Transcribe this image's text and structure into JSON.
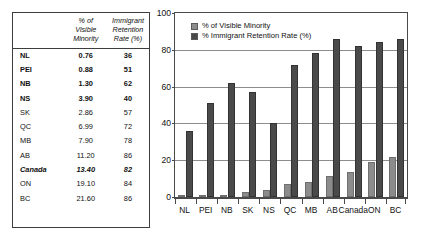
{
  "table": {
    "headers": {
      "corner": "",
      "col1": [
        "% of",
        "Visible",
        "Minority"
      ],
      "col2": [
        "Immigrant",
        "Retention",
        "Rate (%)"
      ]
    },
    "rows": [
      {
        "label": "NL",
        "visible_minority": "0.76",
        "retention_rate": "36",
        "emphasis": "bold"
      },
      {
        "label": "PEI",
        "visible_minority": "0.88",
        "retention_rate": "51",
        "emphasis": "bold"
      },
      {
        "label": "NB",
        "visible_minority": "1.30",
        "retention_rate": "62",
        "emphasis": "bold"
      },
      {
        "label": "NS",
        "visible_minority": "3.90",
        "retention_rate": "40",
        "emphasis": "bold"
      },
      {
        "label": "SK",
        "visible_minority": "2.86",
        "retention_rate": "57",
        "emphasis": "normal"
      },
      {
        "label": "QC",
        "visible_minority": "6.99",
        "retention_rate": "72",
        "emphasis": "normal"
      },
      {
        "label": "MB",
        "visible_minority": "7.90",
        "retention_rate": "78",
        "emphasis": "normal"
      },
      {
        "label": "AB",
        "visible_minority": "11.20",
        "retention_rate": "86",
        "emphasis": "normal"
      },
      {
        "label": "Canada",
        "visible_minority": "13.40",
        "retention_rate": "82",
        "emphasis": "bolditalic"
      },
      {
        "label": "ON",
        "visible_minority": "19.10",
        "retention_rate": "84",
        "emphasis": "normal"
      },
      {
        "label": "BC",
        "visible_minority": "21.60",
        "retention_rate": "86",
        "emphasis": "normal"
      }
    ]
  },
  "chart_data": {
    "type": "bar",
    "title": "",
    "xlabel": "",
    "ylabel": "",
    "ylim": [
      0,
      100
    ],
    "yticks": [
      "0",
      "20",
      "40",
      "60",
      "80",
      "100"
    ],
    "grid": true,
    "legend_position": "top-left",
    "categories": [
      "NL",
      "PEI",
      "NB",
      "SK",
      "NS",
      "QC",
      "MB",
      "AB",
      "Canada",
      "ON",
      "BC"
    ],
    "series": [
      {
        "name": "% of Visible Minority",
        "color": "#8c8c8c",
        "values": [
          0.76,
          0.88,
          1.3,
          2.86,
          3.9,
          6.99,
          7.9,
          11.2,
          13.4,
          19.1,
          21.6
        ]
      },
      {
        "name": "% Immigrant Retention Rate (%)",
        "color": "#4a4a4a",
        "values": [
          36,
          51,
          62,
          57,
          40,
          72,
          78,
          86,
          82,
          84,
          86
        ]
      }
    ]
  },
  "colors": {
    "series1": "#8c8c8c",
    "series2": "#4a4a4a",
    "grid": "#8d8d8d",
    "axis": "#4a4a4a",
    "border": "#3d3d3d",
    "text": "#111111"
  }
}
